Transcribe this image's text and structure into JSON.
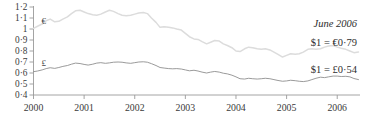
{
  "chart_data": {
    "type": "line",
    "title": "",
    "xlabel": "",
    "ylabel": "",
    "xlim": [
      2000,
      2006.45
    ],
    "ylim": [
      0.4,
      1.2
    ],
    "grid": false,
    "legend_position": "inline-left",
    "ytick_labels": [
      "1·2",
      "1·1",
      "1",
      "0·9",
      "0·8",
      "0·7",
      "0·6",
      "0·5",
      "0·4"
    ],
    "ytick_values": [
      1.2,
      1.1,
      1.0,
      0.9,
      0.8,
      0.7,
      0.6,
      0.5,
      0.4
    ],
    "xtick_labels": [
      "2000",
      "2001",
      "2002",
      "2003",
      "2004",
      "2005",
      "2006"
    ],
    "xtick_values": [
      2000,
      2001,
      2002,
      2003,
      2004,
      2005,
      2006
    ],
    "series": [
      {
        "name": "euro",
        "symbol": "€",
        "symbol_x": 2000.12,
        "symbol_y": 1.075,
        "color": "#dcdcdc",
        "x": [
          2000.0,
          2000.08,
          2000.17,
          2000.25,
          2000.33,
          2000.42,
          2000.5,
          2000.58,
          2000.67,
          2000.75,
          2000.83,
          2000.92,
          2001.0,
          2001.08,
          2001.17,
          2001.25,
          2001.33,
          2001.42,
          2001.5,
          2001.58,
          2001.67,
          2001.75,
          2001.83,
          2001.92,
          2002.0,
          2002.08,
          2002.17,
          2002.25,
          2002.33,
          2002.42,
          2002.5,
          2002.58,
          2002.67,
          2002.75,
          2002.83,
          2002.92,
          2003.0,
          2003.08,
          2003.17,
          2003.25,
          2003.33,
          2003.42,
          2003.5,
          2003.58,
          2003.67,
          2003.75,
          2003.83,
          2003.92,
          2004.0,
          2004.08,
          2004.17,
          2004.25,
          2004.33,
          2004.42,
          2004.5,
          2004.58,
          2004.67,
          2004.75,
          2004.83,
          2004.92,
          2005.0,
          2005.08,
          2005.17,
          2005.25,
          2005.33,
          2005.42,
          2005.5,
          2005.58,
          2005.67,
          2005.75,
          2005.83,
          2005.92,
          2006.0,
          2006.08,
          2006.17,
          2006.25,
          2006.33,
          2006.42
        ],
        "y": [
          1.005,
          1.025,
          1.045,
          1.075,
          1.09,
          1.065,
          1.07,
          1.09,
          1.11,
          1.14,
          1.165,
          1.17,
          1.155,
          1.14,
          1.13,
          1.125,
          1.135,
          1.155,
          1.17,
          1.16,
          1.14,
          1.125,
          1.12,
          1.125,
          1.135,
          1.145,
          1.15,
          1.14,
          1.1,
          1.06,
          1.015,
          1.02,
          1.015,
          1.01,
          1.0,
          0.99,
          0.96,
          0.93,
          0.91,
          0.905,
          0.885,
          0.865,
          0.88,
          0.895,
          0.89,
          0.865,
          0.85,
          0.83,
          0.8,
          0.795,
          0.82,
          0.835,
          0.83,
          0.82,
          0.815,
          0.82,
          0.81,
          0.79,
          0.77,
          0.745,
          0.76,
          0.775,
          0.77,
          0.775,
          0.79,
          0.815,
          0.82,
          0.815,
          0.82,
          0.835,
          0.845,
          0.85,
          0.835,
          0.825,
          0.815,
          0.8,
          0.785,
          0.79
        ]
      },
      {
        "name": "pound",
        "symbol": "£",
        "symbol_x": 2000.12,
        "symbol_y": 0.688,
        "color": "#8e8e8e",
        "x": [
          2000.0,
          2000.08,
          2000.17,
          2000.25,
          2000.33,
          2000.42,
          2000.5,
          2000.58,
          2000.67,
          2000.75,
          2000.83,
          2000.92,
          2001.0,
          2001.08,
          2001.17,
          2001.25,
          2001.33,
          2001.42,
          2001.5,
          2001.58,
          2001.67,
          2001.75,
          2001.83,
          2001.92,
          2002.0,
          2002.08,
          2002.17,
          2002.25,
          2002.33,
          2002.42,
          2002.5,
          2002.58,
          2002.67,
          2002.75,
          2002.83,
          2002.92,
          2003.0,
          2003.08,
          2003.17,
          2003.25,
          2003.33,
          2003.42,
          2003.5,
          2003.58,
          2003.67,
          2003.75,
          2003.83,
          2003.92,
          2004.0,
          2004.08,
          2004.17,
          2004.25,
          2004.33,
          2004.42,
          2004.5,
          2004.58,
          2004.67,
          2004.75,
          2004.83,
          2004.92,
          2005.0,
          2005.08,
          2005.17,
          2005.25,
          2005.33,
          2005.42,
          2005.5,
          2005.58,
          2005.67,
          2005.75,
          2005.83,
          2005.92,
          2006.0,
          2006.08,
          2006.17,
          2006.25,
          2006.33,
          2006.42
        ],
        "y": [
          0.612,
          0.618,
          0.628,
          0.64,
          0.648,
          0.642,
          0.65,
          0.66,
          0.668,
          0.68,
          0.69,
          0.686,
          0.678,
          0.672,
          0.68,
          0.69,
          0.694,
          0.688,
          0.692,
          0.698,
          0.7,
          0.698,
          0.692,
          0.688,
          0.694,
          0.7,
          0.702,
          0.698,
          0.685,
          0.668,
          0.65,
          0.645,
          0.64,
          0.638,
          0.64,
          0.636,
          0.628,
          0.62,
          0.625,
          0.618,
          0.608,
          0.6,
          0.608,
          0.614,
          0.608,
          0.598,
          0.592,
          0.58,
          0.565,
          0.548,
          0.545,
          0.552,
          0.548,
          0.545,
          0.548,
          0.552,
          0.548,
          0.54,
          0.532,
          0.525,
          0.528,
          0.534,
          0.53,
          0.525,
          0.522,
          0.528,
          0.54,
          0.552,
          0.562,
          0.558,
          0.565,
          0.572,
          0.572,
          0.568,
          0.57,
          0.565,
          0.55,
          0.54
        ]
      }
    ],
    "annotations": [
      {
        "name": "date-annotation",
        "text": "June 2006",
        "style": "italic"
      },
      {
        "name": "euro-rate-annotation",
        "text": "$1 = €0·79",
        "style": "roman"
      },
      {
        "name": "pound-rate-annotation",
        "text": "$1 = £0·54",
        "style": "roman"
      }
    ]
  }
}
